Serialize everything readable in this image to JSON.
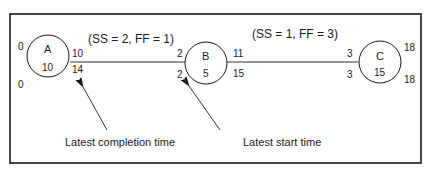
{
  "diagram": {
    "type": "precedence-network",
    "nodes": [
      {
        "id": "A",
        "label": "A",
        "duration": "10",
        "es": "0",
        "ef": "10",
        "ls": "0",
        "lf": "14"
      },
      {
        "id": "B",
        "label": "B",
        "duration": "5",
        "es": "2",
        "ef": "11",
        "ls": "2",
        "lf": "15"
      },
      {
        "id": "C",
        "label": "C",
        "duration": "15",
        "es": "3",
        "ef": "18",
        "ls": "3",
        "lf": "18"
      }
    ],
    "node_values": {
      "A": {
        "left_top": "0",
        "left_bottom": "0",
        "right_top": "10",
        "right_bottom": "14"
      },
      "B": {
        "left_top": "2",
        "left_bottom": "2",
        "right_top": "11",
        "right_bottom": "15"
      },
      "C": {
        "left_top": "3",
        "left_bottom": "3",
        "right_top": "18",
        "right_bottom": "18"
      }
    },
    "edges": [
      {
        "from": "A",
        "to": "B",
        "label": "(SS = 2,  FF = 1)"
      },
      {
        "from": "B",
        "to": "C",
        "label": "(SS = 1,  FF = 3)"
      }
    ],
    "annotations": [
      {
        "text": "Latest completion time",
        "points_to": "A right-bottom value 14"
      },
      {
        "text": "Latest start time",
        "points_to": "B left-bottom value 2"
      }
    ]
  }
}
